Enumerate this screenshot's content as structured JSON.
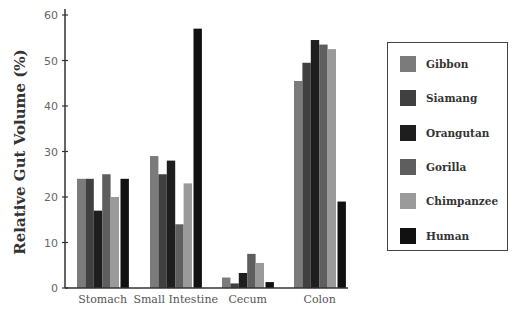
{
  "chart_data": {
    "type": "bar",
    "title": "",
    "xlabel": "",
    "ylabel": "Relative Gut Volume (%)",
    "ylim": [
      0,
      60
    ],
    "yticks": [
      0,
      10,
      20,
      30,
      40,
      50,
      60
    ],
    "grid": false,
    "legend_position": "right",
    "categories": [
      "Stomach",
      "Small Intestine",
      "Cecum",
      "Colon"
    ],
    "series": [
      {
        "name": "Gibbon",
        "color": "#7b7b7b",
        "values": [
          24,
          29,
          2.3,
          45.5
        ]
      },
      {
        "name": "Siamang",
        "color": "#404040",
        "values": [
          24,
          25,
          1,
          49.5
        ]
      },
      {
        "name": "Orangutan",
        "color": "#1e1e1e",
        "values": [
          17,
          28,
          3.3,
          54.5
        ]
      },
      {
        "name": "Gorilla",
        "color": "#5e5e5e",
        "values": [
          25,
          14,
          7.5,
          53.5
        ]
      },
      {
        "name": "Chimpanzee",
        "color": "#9a9a9a",
        "values": [
          20,
          23,
          5.5,
          52.5
        ]
      },
      {
        "name": "Human",
        "color": "#111111",
        "values": [
          24,
          57,
          1.3,
          19
        ]
      }
    ]
  }
}
